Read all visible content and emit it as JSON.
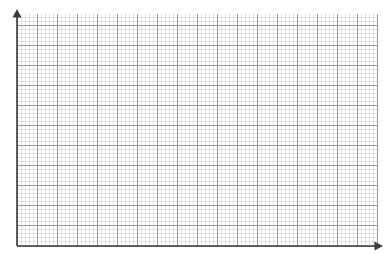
{
  "canvas": {
    "width": 392,
    "height": 254,
    "background": "#ffffff"
  },
  "figure": {
    "title": "",
    "type": "graph-paper"
  },
  "chart_data": {
    "type": "scatter",
    "title": "",
    "subtitle": "",
    "xlabel": "",
    "ylabel": "",
    "x": [],
    "values": [],
    "series": [],
    "categories": [],
    "tick_labels_x": [],
    "tick_labels_y": [],
    "legend_entries": [],
    "annotations": [],
    "grid": true,
    "legend_position": "none",
    "xlim": [
      0,
      90
    ],
    "ylim": [
      0,
      58
    ],
    "axis_style": "arrow-both-ends",
    "grid_minor_step": 1,
    "grid_major_step": 5,
    "grid_minor_count_x": 90,
    "grid_minor_count_y": 58,
    "grid_major_count_x": 18,
    "grid_major_count_y": 11
  },
  "grid": {
    "left": 17,
    "top": 14,
    "right": 378,
    "bottom": 246,
    "minor_step_px": 4.01,
    "major_every": 5,
    "minor_color": "#d6d6d6",
    "major_color": "#9a9a9a",
    "minor_width": 0.7,
    "major_width": 1.0
  },
  "axes": {
    "color": "#3c3c3c",
    "width": 1.6,
    "y_axis": {
      "name": "vertical-axis",
      "x": 17,
      "from_y": 246,
      "to_y": 12,
      "arrow_tip_y": 9,
      "arrow_size": 4.5,
      "label": ""
    },
    "x_axis": {
      "name": "horizontal-axis",
      "y": 246,
      "from_x": 17,
      "to_x": 379,
      "arrow_tip_x": 383,
      "arrow_size": 4.5,
      "label": ""
    },
    "origin": {
      "x": 17,
      "y": 246,
      "label": ""
    }
  }
}
